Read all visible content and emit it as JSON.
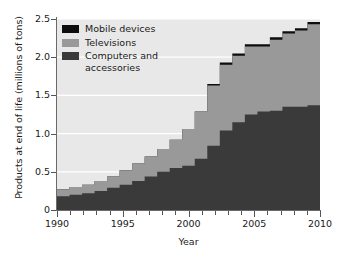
{
  "chart_data": {
    "type": "area",
    "title": "",
    "xlabel": "Year",
    "ylabel": "Products at end of life (millions of tons)",
    "xlim": [
      1990,
      2010
    ],
    "ylim": [
      0,
      2.5
    ],
    "grid": true,
    "legend_position": "upper-left",
    "stacked": true,
    "x": [
      1990,
      1991,
      1992,
      1993,
      1994,
      1995,
      1996,
      1997,
      1998,
      1999,
      2000,
      2001,
      2002,
      2003,
      2004,
      2005,
      2006,
      2007,
      2008,
      2009,
      2010
    ],
    "xticks": [
      1990,
      1995,
      2000,
      2005,
      2010
    ],
    "xtick_labels": [
      "1990",
      "1995",
      "2000",
      "2005",
      "2010"
    ],
    "yticks": [
      0,
      0.5,
      1.0,
      1.5,
      2.0,
      2.5
    ],
    "ytick_labels": [
      "0",
      "0.5",
      "1.0",
      "1.5",
      "2.0",
      "2.5"
    ],
    "series": [
      {
        "name": "Computers and accessories",
        "color": "#3a3a3a",
        "values": [
          0.18,
          0.2,
          0.22,
          0.25,
          0.29,
          0.33,
          0.38,
          0.44,
          0.5,
          0.55,
          0.58,
          0.67,
          0.84,
          1.04,
          1.15,
          1.25,
          1.29,
          1.3,
          1.35,
          1.35,
          1.37
        ]
      },
      {
        "name": "Televisions",
        "color": "#999999",
        "values": [
          0.09,
          0.1,
          0.11,
          0.13,
          0.15,
          0.19,
          0.23,
          0.26,
          0.3,
          0.37,
          0.48,
          0.62,
          0.79,
          0.86,
          0.87,
          0.89,
          0.85,
          0.93,
          0.96,
          1.0,
          1.06
        ]
      },
      {
        "name": "Mobile devices",
        "color": "#0d0d0d",
        "values": [
          0,
          0,
          0,
          0,
          0,
          0,
          0,
          0,
          0,
          0,
          0,
          0,
          0.02,
          0.03,
          0.03,
          0.03,
          0.03,
          0.03,
          0.03,
          0.03,
          0.03
        ]
      }
    ],
    "series_totals": [
      0.27,
      0.3,
      0.33,
      0.38,
      0.44,
      0.52,
      0.61,
      0.7,
      0.8,
      0.92,
      1.06,
      1.29,
      1.65,
      1.93,
      2.05,
      2.17,
      2.17,
      2.26,
      2.34,
      2.38,
      2.46
    ],
    "colors": {
      "plot_background": "#e8e8e8",
      "gridline": "#ffffff",
      "axis": "#6a6a6a",
      "text": "#1a1a1a",
      "figure_background": "#ffffff"
    }
  },
  "legend": {
    "items": [
      {
        "label": "Mobile devices",
        "color": "#0d0d0d"
      },
      {
        "label": "Televisions",
        "color": "#999999"
      },
      {
        "label": "Computers and\naccessories",
        "color": "#3a3a3a"
      }
    ]
  },
  "axes": {
    "y_title": "Products at end of life (millions of tons)",
    "x_title": "Year"
  }
}
